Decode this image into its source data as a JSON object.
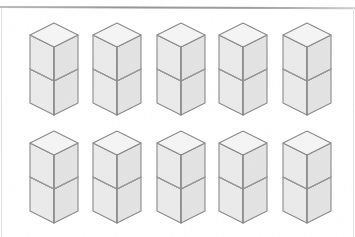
{
  "figure": {
    "background_color": "#ffffff",
    "rows": 2,
    "columns": 5,
    "total_stacks": 10,
    "cubes_per_stack": 2,
    "total_cubes": 20
  },
  "rules": {
    "top_rule": {
      "name": "top-horizontal-rule",
      "color": "#8f8f91",
      "thickness_px": 2,
      "y_px": 6
    },
    "left_rule": {
      "name": "left-margin-rule",
      "color": "#dedede",
      "thickness_px": 1
    },
    "right_rule": {
      "name": "right-margin-rule",
      "color": "#e4e4e4",
      "thickness_px": 1
    }
  },
  "cube_style": {
    "top_face_color": "#f4f4f4",
    "left_face_color": "#eaeaea",
    "right_face_color": "#e3e3e3",
    "outline_color": "#8a8a8c",
    "inner_edge_color": "#9a9a9c",
    "outline_width_px": 1.1,
    "half_width_px": 24,
    "top_half_height_px": 12,
    "cube_side_height_px": 34
  },
  "stacks": [
    {
      "id": "r1c1",
      "name": "cube-stack-row1-col1",
      "row": 1,
      "column": 1,
      "cubes": 2,
      "x": 27,
      "y": 20
    },
    {
      "id": "r1c2",
      "name": "cube-stack-row1-col2",
      "row": 1,
      "column": 2,
      "cubes": 2,
      "x": 90,
      "y": 20
    },
    {
      "id": "r1c3",
      "name": "cube-stack-row1-col3",
      "row": 1,
      "column": 3,
      "cubes": 2,
      "x": 154,
      "y": 20
    },
    {
      "id": "r1c4",
      "name": "cube-stack-row1-col4",
      "row": 1,
      "column": 4,
      "cubes": 2,
      "x": 216,
      "y": 20
    },
    {
      "id": "r1c5",
      "name": "cube-stack-row1-col5",
      "row": 1,
      "column": 5,
      "cubes": 2,
      "x": 280,
      "y": 20
    },
    {
      "id": "r2c1",
      "name": "cube-stack-row2-col1",
      "row": 2,
      "column": 1,
      "cubes": 2,
      "x": 27,
      "y": 128
    },
    {
      "id": "r2c2",
      "name": "cube-stack-row2-col2",
      "row": 2,
      "column": 2,
      "cubes": 2,
      "x": 90,
      "y": 128
    },
    {
      "id": "r2c3",
      "name": "cube-stack-row2-col3",
      "row": 2,
      "column": 3,
      "cubes": 2,
      "x": 154,
      "y": 128
    },
    {
      "id": "r2c4",
      "name": "cube-stack-row2-col4",
      "row": 2,
      "column": 4,
      "cubes": 2,
      "x": 216,
      "y": 128
    },
    {
      "id": "r2c5",
      "name": "cube-stack-row2-col5",
      "row": 2,
      "column": 5,
      "cubes": 2,
      "x": 280,
      "y": 128
    }
  ]
}
